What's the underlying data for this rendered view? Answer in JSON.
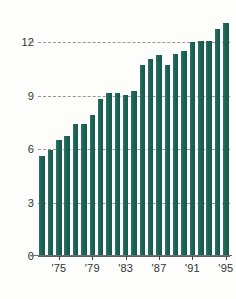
{
  "chart_data": {
    "type": "bar",
    "title": "",
    "subtitle": "",
    "xlabel": "",
    "ylabel": "",
    "categories": [
      "1973",
      "1974",
      "1975",
      "1976",
      "1977",
      "1978",
      "1979",
      "1980",
      "1981",
      "1982",
      "1983",
      "1984",
      "1985",
      "1986",
      "1987",
      "1988",
      "1989",
      "1990",
      "1991",
      "1992",
      "1993",
      "1994",
      "1995"
    ],
    "values": [
      5.6,
      5.95,
      6.5,
      6.75,
      7.4,
      7.4,
      7.95,
      8.85,
      9.15,
      9.15,
      9.05,
      9.3,
      10.75,
      11.1,
      11.3,
      10.75,
      11.35,
      11.5,
      12.05,
      12.1,
      12.1,
      12.75,
      13.1
    ],
    "bar_color": "#1d6456",
    "ylim": [
      0,
      13.6
    ],
    "yticks": [
      0,
      3,
      6,
      9,
      12
    ],
    "ytick_labels": [
      "0",
      "3",
      "6",
      "9",
      "12"
    ],
    "xtick_positions": [
      "1975",
      "1979",
      "1983",
      "1987",
      "1991",
      "1995"
    ],
    "xtick_labels": [
      "'75",
      "'79",
      "'83",
      "'87",
      "'91",
      "'95"
    ],
    "grid": true,
    "grid_style": "dashed-horizontal",
    "legend": null,
    "legend_position": "none",
    "background_color": "#fdfdfc",
    "axis_color": "#2f3436"
  }
}
